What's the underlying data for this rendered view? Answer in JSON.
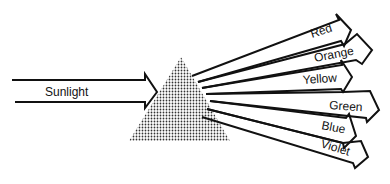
{
  "diagram": {
    "type": "prism-dispersion",
    "input": {
      "label": "Sunlight"
    },
    "prism": {
      "fill": "stippled-gray"
    },
    "outputs": [
      {
        "label": "Red"
      },
      {
        "label": "Orange"
      },
      {
        "label": "Yellow"
      },
      {
        "label": "Green"
      },
      {
        "label": "Blue"
      },
      {
        "label": "Violet"
      }
    ]
  },
  "colors": {
    "line": "#111111",
    "prism_dot": "#333333",
    "background": "#ffffff"
  }
}
